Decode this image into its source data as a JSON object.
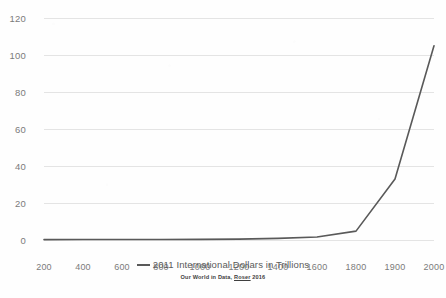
{
  "chart_data": {
    "type": "line",
    "title": "",
    "subtitle": "",
    "xlabel": "",
    "ylabel": "",
    "categories": [
      "200",
      "400",
      "600",
      "800",
      "1000",
      "1200",
      "1400",
      "1600",
      "1800",
      "1900",
      "2000"
    ],
    "series": [
      {
        "name": "2011 International Dollars in Trillions",
        "color": "#595959",
        "values": [
          0.2,
          0.25,
          0.25,
          0.3,
          0.35,
          0.45,
          0.9,
          1.6,
          4.8,
          33,
          105
        ]
      }
    ],
    "ylim": [
      0,
      120
    ],
    "ytick_labels": [
      "0",
      "20",
      "40",
      "60",
      "80",
      "100",
      "120"
    ],
    "ytick_values": [
      0,
      20,
      40,
      60,
      80,
      100,
      120
    ],
    "grid": "horizontal",
    "legend_position": "bottom",
    "annotations": []
  },
  "legend": {
    "entries": [
      {
        "label": "2011 International Dollars in Trillions"
      }
    ]
  },
  "caption": {
    "prefix": "Our World in Data, ",
    "link_text": "Roser",
    "suffix": " 2016"
  },
  "colors": {
    "series_line": "#595959",
    "gridline": "#e4e4e4",
    "tick_text": "#7b7b7b",
    "legend_text": "#5a5a5a",
    "background": "#fefefe"
  }
}
